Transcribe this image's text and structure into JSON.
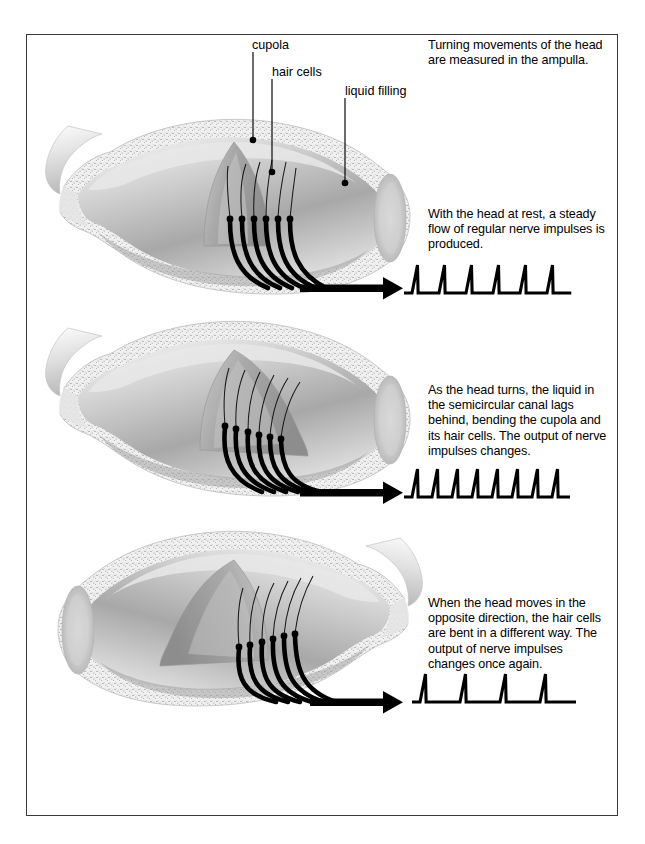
{
  "figure": {
    "title_semantics": "vestibular-ampulla-cupola-nerve-impulse-diagram",
    "border_color": "#3a3a3a",
    "background": "#ffffff"
  },
  "callout_labels": [
    {
      "name": "cupola",
      "text": "cupola",
      "x": 252,
      "y": 45,
      "dot_x": 253,
      "dot_y": 140
    },
    {
      "name": "hair-cells",
      "text": "hair cells",
      "x": 272,
      "y": 72,
      "dot_x": 272,
      "dot_y": 172
    },
    {
      "name": "liquid-filling",
      "text": "liquid filling",
      "x": 345,
      "y": 91,
      "dot_x": 345,
      "dot_y": 183
    }
  ],
  "panels": [
    {
      "id": "panel-rest",
      "caption": "Turning movements of the head\nare measured in the ampulla.",
      "caption_x": 428,
      "caption_y": 38,
      "cupola_state": "upright",
      "arrow_label": "nerve-output-arrow"
    },
    {
      "id": "panel-turning",
      "caption": "With the head at rest, a steady\nflow of regular nerve impulses is\nproduced.",
      "caption_x": 428,
      "caption_y": 207,
      "cupola_state": "bent-right",
      "arrow_label": "nerve-output-arrow"
    },
    {
      "id": "panel-opposite",
      "caption": "As the head turns, the liquid in\nthe semicircular canal lags\nbehind, bending the cupola and\nits hair cells. The output of nerve\nimpulses changes.",
      "caption_x": 428,
      "caption_y": 383,
      "cupola_state": "bent-left",
      "arrow_label": "nerve-output-arrow"
    },
    {
      "id": "panel-opposite-caption",
      "caption": "When the head moves in the\nopposite direction, the hair cells\nare bent in a different way. The\noutput of nerve impulses\nchanges once again.",
      "caption_x": 428,
      "caption_y": 596,
      "cupola_state": "none",
      "arrow_label": ""
    }
  ],
  "chart_data": {
    "type": "line",
    "xlabel": "time",
    "ylabel": "nerve impulse",
    "grid": false,
    "legend": "none",
    "series": [
      {
        "name": "impulse-train-rest",
        "spike_count": 6,
        "baseline_y": 293,
        "peak_y": 265,
        "x_start": 412,
        "spacing": 27,
        "description": "steady regular impulses at rest"
      },
      {
        "name": "impulse-train-turning",
        "spike_count": 8,
        "baseline_y": 497,
        "peak_y": 469,
        "x_start": 412,
        "spacing": 20,
        "description": "increased impulse frequency while head turns"
      },
      {
        "name": "impulse-train-opposite",
        "spike_count": 4,
        "baseline_y": 702,
        "peak_y": 674,
        "x_start": 420,
        "spacing": 40,
        "description": "reduced impulse frequency in opposite direction"
      }
    ]
  },
  "colors": {
    "ink": "#000000",
    "border": "#3a3a3a",
    "tissue_light": "#f2f2f2",
    "tissue_mid": "#bdbdbd",
    "tissue_dark": "#8e8e8e",
    "stipple": "#e9e9e9"
  }
}
